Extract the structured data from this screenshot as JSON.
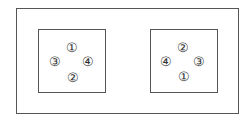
{
  "diagram": {
    "left_box": {
      "items": [
        {
          "label": "①",
          "x": 72,
          "y": 47
        },
        {
          "label": "③",
          "x": 55,
          "y": 61
        },
        {
          "label": "④",
          "x": 88,
          "y": 61
        },
        {
          "label": "②",
          "x": 73,
          "y": 77
        }
      ]
    },
    "right_box": {
      "items": [
        {
          "label": "②",
          "x": 183,
          "y": 47
        },
        {
          "label": "④",
          "x": 166,
          "y": 61
        },
        {
          "label": "③",
          "x": 199,
          "y": 61
        },
        {
          "label": "①",
          "x": 184,
          "y": 76
        }
      ]
    }
  }
}
